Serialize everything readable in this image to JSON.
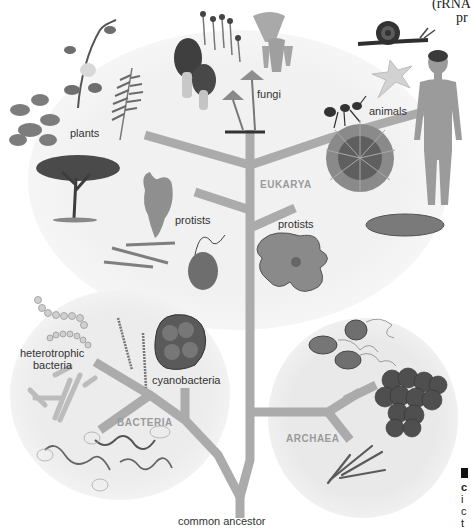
{
  "figure": {
    "type": "phylogenetic tree of life",
    "domains": {
      "eukarya": "EUKARYA",
      "bacteria": "BACTERIA",
      "archaea": "ARCHAEA"
    },
    "labels": {
      "plants": "plants",
      "fungi": "fungi",
      "animals": "animals",
      "protists_left": "protists",
      "protists_right": "protists",
      "heterotrophic_bacteria_line1": "heterotrophic",
      "heterotrophic_bacteria_line2": "bacteria",
      "cyanobacteria": "cyanobacteria",
      "common_ancestor": "common ancestor"
    },
    "cropped_text": {
      "top_right_line1": "(rRNA",
      "top_right_line2": "pr",
      "bottom_right_lines": [
        "",
        "c",
        "i",
        "c",
        "t"
      ]
    },
    "colors": {
      "branch": "#ababab",
      "domain_label": "#9a9a9a",
      "eukarya_bg": "#efefef",
      "bacteria_bg": "#ececec",
      "archaea_bg": "#eaeaea"
    }
  }
}
